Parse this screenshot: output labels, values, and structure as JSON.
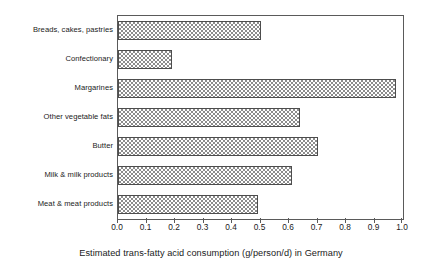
{
  "chart_data": {
    "type": "bar",
    "orientation": "horizontal",
    "title": "",
    "xlabel": "Estimated trans-fatty acid consumption (g/person/d) in Germany",
    "ylabel": "",
    "categories": [
      "Breads, cakes, pastries",
      "Confectionary",
      "Margarines",
      "Other vegetable fats",
      "Butter",
      "Milk & milk products",
      "Meat & meat products"
    ],
    "values": [
      0.5,
      0.19,
      0.975,
      0.64,
      0.7,
      0.61,
      0.49
    ],
    "xlim": [
      0.0,
      1.0
    ],
    "xticks": [
      0.0,
      0.1,
      0.2,
      0.3,
      0.4,
      0.5,
      0.6,
      0.7,
      0.8,
      0.9,
      1.0
    ],
    "xticklabels": [
      "0.0",
      "0.1",
      "0.2",
      "0.3",
      "0.4",
      "0.5",
      "0.6",
      "0.7",
      "0.8",
      "0.9",
      "1.0"
    ],
    "grid": false,
    "legend": null,
    "bar_fill": "checkerboard",
    "colors": {
      "bar_pattern": "#8c8c8c",
      "bar_background": "#ffffff",
      "bar_border": "#4d4d4d",
      "axis": "#5a5a5a",
      "text": "#1a1a1a",
      "plot_background": "#ffffff"
    }
  }
}
